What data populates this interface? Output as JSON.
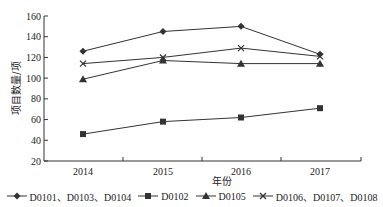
{
  "chart_data": {
    "type": "line",
    "title": "",
    "xlabel": "年份",
    "ylabel": "项目数量/项",
    "x": [
      "2014",
      "2015",
      "2016",
      "2017"
    ],
    "ylim": [
      20,
      160
    ],
    "yticks": [
      20,
      40,
      60,
      80,
      100,
      120,
      140,
      160
    ],
    "grid": false,
    "legend_position": "bottom",
    "series": [
      {
        "name": "D0101、D0103、D0104",
        "marker": "diamond",
        "values": [
          126,
          145,
          150,
          123
        ]
      },
      {
        "name": "D0102",
        "marker": "square",
        "values": [
          46,
          58,
          62,
          71
        ]
      },
      {
        "name": "D0105",
        "marker": "triangle",
        "values": [
          99,
          117,
          114,
          114
        ]
      },
      {
        "name": "D0106、D0107、D0108",
        "marker": "x",
        "values": [
          114,
          120,
          129,
          121
        ]
      }
    ]
  },
  "colors": {
    "line": "#333333",
    "axis": "#333333"
  }
}
